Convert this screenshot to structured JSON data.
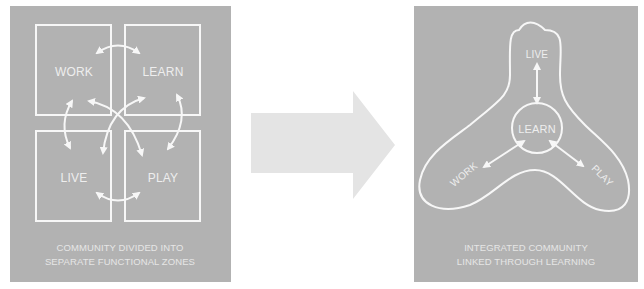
{
  "left_panel": {
    "zones": [
      "WORK",
      "LEARN",
      "LIVE",
      "PLAY"
    ],
    "caption_line1": "COMMUNITY DIVIDED INTO",
    "caption_line2": "SEPARATE FUNCTIONAL ZONES"
  },
  "right_panel": {
    "center": "LEARN",
    "lobes": [
      "LIVE",
      "WORK",
      "PLAY"
    ],
    "caption_line1": "INTEGRATED COMMUNITY",
    "caption_line2": "LINKED THROUGH LEARNING"
  },
  "colors": {
    "panel_bg": "#b2b2b2",
    "line": "#f7f7f7",
    "transition_arrow": "#e4e4e4"
  }
}
